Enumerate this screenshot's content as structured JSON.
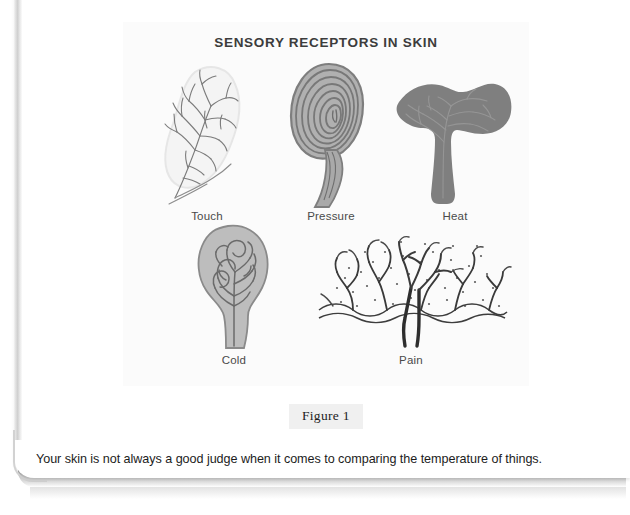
{
  "figure": {
    "title": "SENSORY RECEPTORS IN SKIN",
    "caption": "Figure 1",
    "receptors": [
      {
        "label": "Touch",
        "icon": "touch-receptor-icon"
      },
      {
        "label": "Pressure",
        "icon": "pressure-receptor-icon"
      },
      {
        "label": "Heat",
        "icon": "heat-receptor-icon"
      },
      {
        "label": "Cold",
        "icon": "cold-receptor-icon"
      },
      {
        "label": "Pain",
        "icon": "pain-receptor-icon"
      }
    ]
  },
  "body": {
    "sentence": "Your skin is not always a good judge when it comes to comparing the temperature of things."
  },
  "colors": {
    "panel_background": "#fbfbfb",
    "title_text": "#3c3c3c",
    "label_text": "#4a4a4a",
    "caption_chip_background": "#f0f0f0",
    "body_text": "#1c1c1c",
    "receptor_dark_gray": "#6f6f6f",
    "receptor_mid_gray": "#8f8f8f",
    "receptor_light_gray": "#bdbdbd",
    "receptor_pale_fill": "#f2f2f2",
    "page_shadow": "#9d9d9d"
  }
}
